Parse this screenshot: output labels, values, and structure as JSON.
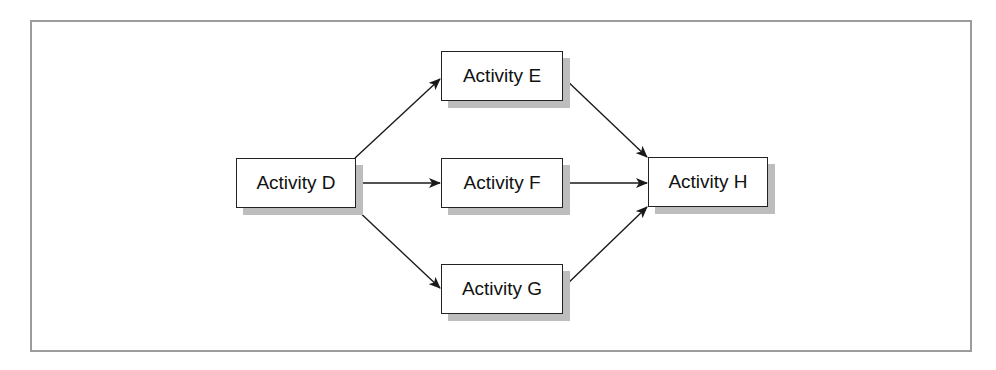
{
  "diagram": {
    "type": "activity-network",
    "nodes": [
      {
        "id": "D",
        "label": "Activity D",
        "x": 236,
        "y": 158,
        "w": 120,
        "h": 50
      },
      {
        "id": "E",
        "label": "Activity E",
        "x": 441,
        "y": 51,
        "w": 122,
        "h": 50
      },
      {
        "id": "F",
        "label": "Activity F",
        "x": 441,
        "y": 158,
        "w": 122,
        "h": 50
      },
      {
        "id": "G",
        "label": "Activity G",
        "x": 441,
        "y": 264,
        "w": 122,
        "h": 50
      },
      {
        "id": "H",
        "label": "Activity H",
        "x": 648,
        "y": 157,
        "w": 120,
        "h": 50
      }
    ],
    "edges": [
      {
        "from": "D",
        "to": "E"
      },
      {
        "from": "D",
        "to": "F"
      },
      {
        "from": "D",
        "to": "G"
      },
      {
        "from": "E",
        "to": "H"
      },
      {
        "from": "F",
        "to": "H"
      },
      {
        "from": "G",
        "to": "H"
      }
    ],
    "colors": {
      "frame_border": "#9c9c9c",
      "node_border": "#222222",
      "node_shadow": "#bdbdbd",
      "arrow": "#1a1a1a"
    }
  }
}
